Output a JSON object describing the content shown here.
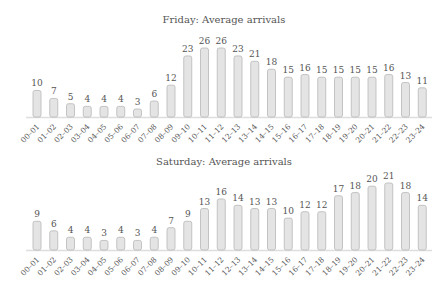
{
  "chart_data": [
    {
      "type": "bar",
      "title": "Friday: Average arrivals",
      "xlabel": "",
      "ylabel": "",
      "categories": [
        "00–01",
        "01–02",
        "02–03",
        "03–04",
        "04–05",
        "05–06",
        "06–07",
        "07–08",
        "08–09",
        "09–10",
        "10–11",
        "11–12",
        "12–13",
        "13–14",
        "14–15",
        "15–16",
        "16–17",
        "17–18",
        "18–19",
        "19–20",
        "20–21",
        "21–22",
        "22–23",
        "23–24"
      ],
      "values": [
        10,
        7,
        5,
        4,
        4,
        4,
        3,
        6,
        12,
        23,
        26,
        26,
        23,
        21,
        18,
        15,
        16,
        15,
        15,
        15,
        15,
        16,
        13,
        11
      ],
      "ylim": [
        0,
        26
      ],
      "grid": false,
      "data_labels": true
    },
    {
      "type": "bar",
      "title": "Saturday: Average arrivals",
      "xlabel": "",
      "ylabel": "",
      "categories": [
        "00–01",
        "01–02",
        "02–03",
        "03–04",
        "04–05",
        "05–06",
        "06–07",
        "07–08",
        "08–09",
        "09–10",
        "10–11",
        "11–12",
        "12–13",
        "13–14",
        "14–15",
        "15–16",
        "16–17",
        "17–18",
        "18–19",
        "19–20",
        "20–21",
        "21–22",
        "22–23",
        "23–24"
      ],
      "values": [
        9,
        6,
        4,
        4,
        3,
        4,
        3,
        4,
        7,
        9,
        13,
        16,
        14,
        13,
        13,
        10,
        12,
        12,
        17,
        18,
        20,
        21,
        18,
        14
      ],
      "ylim": [
        0,
        21
      ],
      "grid": false,
      "data_labels": true
    }
  ],
  "style": {
    "bar_fill": "#e4e4e4",
    "bar_stroke": "#b8b8b8",
    "text_color": "#555555",
    "baseline_color": "#dddddd"
  }
}
